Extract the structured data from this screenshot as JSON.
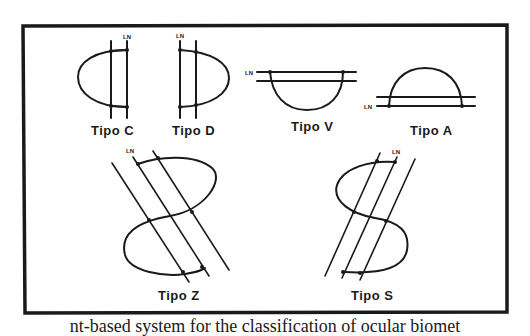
{
  "figure": {
    "types": [
      {
        "id": "C",
        "label": "Tipo C",
        "line_label": "LN"
      },
      {
        "id": "D",
        "label": "Tipo D",
        "line_label": "LN"
      },
      {
        "id": "V",
        "label": "Tipo V",
        "line_label": "LN"
      },
      {
        "id": "A",
        "label": "Tipo A",
        "line_label": "LN"
      },
      {
        "id": "Z",
        "label": "Tipo Z",
        "line_label": "LN"
      },
      {
        "id": "S",
        "label": "Tipo S",
        "line_label": "LN"
      }
    ]
  },
  "caption": {
    "partial_text": "nt-based system for the classification of ocular biomet"
  }
}
